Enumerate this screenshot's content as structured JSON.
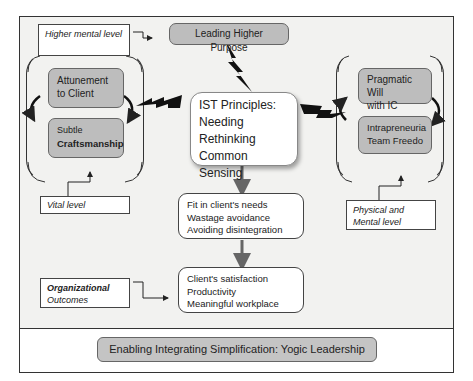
{
  "labels": {
    "higher_mental_level": "Higher mental level",
    "vital_level": "Vital level",
    "physical_mental_level": "Physical and Mental level",
    "organizational_outcomes": [
      "Organizational",
      "Outcomes"
    ]
  },
  "top_box": "Leading Higher Purpose",
  "left_group": {
    "items": [
      [
        "Attunement",
        "to Client"
      ],
      [
        "Subtle",
        "Craftsmanship"
      ]
    ]
  },
  "right_group": {
    "items": [
      [
        "Pragmatic Will",
        "with IC"
      ],
      [
        "Intrapreneuria",
        "Team Freedo"
      ]
    ]
  },
  "center": {
    "title": "IST Principles:",
    "lines": [
      "Needing",
      "Rethinking",
      "Common Sensing"
    ]
  },
  "middle_box": {
    "lines": [
      "Fit in client's needs",
      "Wastage avoidance",
      "Avoiding disintegration"
    ]
  },
  "outcome_box": {
    "lines": [
      "Client's satisfaction",
      "Productivity",
      "Meaningful workplace"
    ]
  },
  "footer": "Enabling Integrating Simplification: Yogic Leadership",
  "colors": {
    "grey_box": "#bdbdbd",
    "background": "#f2f2f0",
    "border": "#333333"
  }
}
